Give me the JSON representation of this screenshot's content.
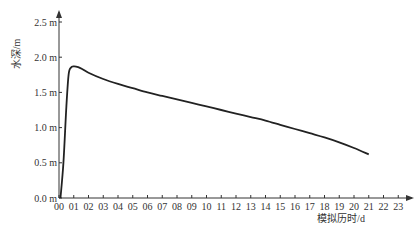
{
  "chart_data": {
    "type": "line",
    "title": "",
    "xlabel": "模拟历时/d",
    "ylabel": "水深/m",
    "xlim": [
      0,
      23
    ],
    "ylim": [
      0,
      2.5
    ],
    "grid": false,
    "legend": null,
    "x_tick_labels": [
      "00",
      "01",
      "02",
      "03",
      "04",
      "05",
      "06",
      "07",
      "08",
      "09",
      "10",
      "11",
      "12",
      "13",
      "14",
      "15",
      "16",
      "17",
      "18",
      "19",
      "20",
      "21",
      "22",
      "23"
    ],
    "y_tick_labels": [
      "0.0 m",
      "0.5 m",
      "1.0 m",
      "1.5 m",
      "2.0 m",
      "2.5 m"
    ],
    "y_tick_values": [
      0,
      0.5,
      1.0,
      1.5,
      2.0,
      2.5
    ],
    "series": [
      {
        "name": "水深",
        "color": "#222222",
        "x": [
          0.1,
          0.3,
          0.5,
          0.65,
          0.8,
          1.0,
          1.3,
          1.6,
          2,
          3,
          4,
          5,
          6,
          7,
          8,
          9,
          10,
          11,
          12,
          13,
          14,
          15,
          16,
          17,
          18,
          19,
          20,
          21
        ],
        "y": [
          0.0,
          0.5,
          1.3,
          1.75,
          1.85,
          1.87,
          1.86,
          1.83,
          1.78,
          1.69,
          1.62,
          1.56,
          1.5,
          1.45,
          1.4,
          1.35,
          1.3,
          1.25,
          1.2,
          1.15,
          1.1,
          1.04,
          0.98,
          0.92,
          0.86,
          0.79,
          0.71,
          0.62
        ]
      }
    ]
  }
}
